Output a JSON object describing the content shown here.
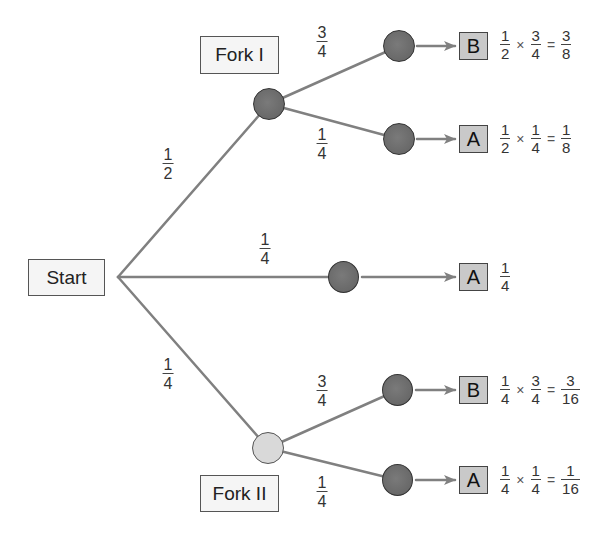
{
  "labels": {
    "start": "Start",
    "fork1": "Fork I",
    "fork2": "Fork II"
  },
  "colors": {
    "edge": "#7f7f7f",
    "node_dark": "#6b6b6b",
    "node_light": "#d9d9d9",
    "outcome_fill": "#c9c9c9",
    "label_fill": "#f5f5f5"
  },
  "branches": {
    "start_to_fork1": {
      "num": "1",
      "den": "2"
    },
    "start_to_middle": {
      "num": "1",
      "den": "4"
    },
    "start_to_fork2": {
      "num": "1",
      "den": "4"
    },
    "fork1_upper": {
      "num": "3",
      "den": "4"
    },
    "fork1_lower": {
      "num": "1",
      "den": "4"
    },
    "fork2_upper": {
      "num": "3",
      "den": "4"
    },
    "fork2_lower": {
      "num": "1",
      "den": "4"
    }
  },
  "outcomes": [
    {
      "letter": "B",
      "a": {
        "num": "1",
        "den": "2"
      },
      "op": "×",
      "b": {
        "num": "3",
        "den": "4"
      },
      "eq": "=",
      "r": {
        "num": "3",
        "den": "8"
      }
    },
    {
      "letter": "A",
      "a": {
        "num": "1",
        "den": "2"
      },
      "op": "×",
      "b": {
        "num": "1",
        "den": "4"
      },
      "eq": "=",
      "r": {
        "num": "1",
        "den": "8"
      }
    },
    {
      "letter": "A",
      "r": {
        "num": "1",
        "den": "4"
      }
    },
    {
      "letter": "B",
      "a": {
        "num": "1",
        "den": "4"
      },
      "op": "×",
      "b": {
        "num": "3",
        "den": "4"
      },
      "eq": "=",
      "r": {
        "num": "3",
        "den": "16"
      }
    },
    {
      "letter": "A",
      "a": {
        "num": "1",
        "den": "4"
      },
      "op": "×",
      "b": {
        "num": "1",
        "den": "4"
      },
      "eq": "=",
      "r": {
        "num": "1",
        "den": "16"
      }
    }
  ]
}
